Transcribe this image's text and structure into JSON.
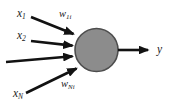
{
  "figure": {
    "type": "neuron-model-diagram",
    "background_color": "#ffffff"
  },
  "neuron": {
    "name": "neuron-body",
    "shape": "circle",
    "fill_color": "#8c8c8c",
    "stroke_color": "#4d4d4d",
    "center_x": 96.5,
    "center_y": 50,
    "radius": 22
  },
  "inputs": [
    {
      "id": "input-1",
      "label": "x",
      "subscript": "1",
      "label_x": 17,
      "label_y": 8,
      "arrow_start_x": 31,
      "arrow_start_y": 17,
      "arrow_end_x": 76,
      "arrow_end_y": 35
    },
    {
      "id": "input-2",
      "label": "x",
      "subscript": "2",
      "label_x": 17,
      "label_y": 30,
      "arrow_start_x": 31,
      "arrow_start_y": 41,
      "arrow_end_x": 75,
      "arrow_end_y": 46
    },
    {
      "id": "input-3",
      "label": "",
      "subscript": "",
      "label_x": 0,
      "label_y": 0,
      "arrow_start_x": 6,
      "arrow_start_y": 62,
      "arrow_end_x": 75,
      "arrow_end_y": 56
    },
    {
      "id": "input-4",
      "label": "x",
      "subscript": "N",
      "label_x": 13,
      "label_y": 88,
      "arrow_start_x": 26,
      "arrow_start_y": 93,
      "arrow_end_x": 79,
      "arrow_end_y": 67
    }
  ],
  "weights": [
    {
      "id": "weight-first",
      "label": "w",
      "subscript": "1i",
      "label_x": 59,
      "label_y": 9
    },
    {
      "id": "weight-last",
      "label": "w",
      "subscript": "Ni",
      "label_x": 61,
      "label_y": 79
    }
  ],
  "output": {
    "id": "output",
    "label": "y",
    "subscript": "",
    "label_x": 157,
    "label_y": 44,
    "arrow_start_x": 118,
    "arrow_start_y": 50,
    "arrow_end_x": 152,
    "arrow_end_y": 50
  },
  "style": {
    "arrow_color": "#121212",
    "arrow_width": 2.6,
    "text_color": "#1a1a1a"
  }
}
